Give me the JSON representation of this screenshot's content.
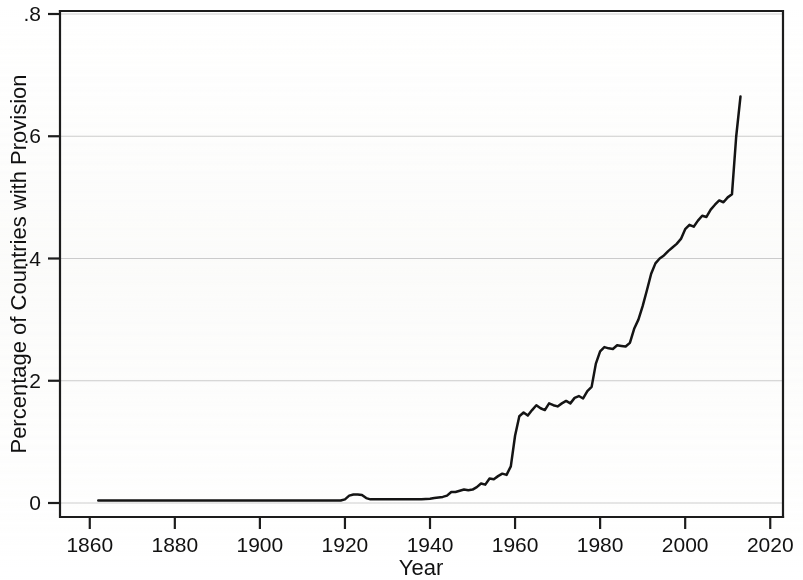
{
  "chart_data": {
    "type": "line",
    "title": "",
    "subtitle": "",
    "xlabel": "Year",
    "ylabel": "Percentage of Countries with Provision",
    "xlim": [
      1853,
      2023
    ],
    "ylim": [
      0,
      0.8
    ],
    "grid": true,
    "grid_axis": "y",
    "legend": false,
    "legend_position": "none",
    "line_color": "#141414",
    "axis_color": "#1c1c1c",
    "grid_color": "#cfcfcf",
    "background_color": "#ffffff",
    "xticks": [
      1860,
      1880,
      1900,
      1920,
      1940,
      1960,
      1980,
      2000,
      2020
    ],
    "xtick_labels": [
      "1860",
      "1880",
      "1900",
      "1920",
      "1940",
      "1960",
      "1980",
      "2000",
      "2020"
    ],
    "yticks": [
      0,
      0.2,
      0.4,
      0.6,
      0.8
    ],
    "ytick_labels": [
      "0",
      ".2",
      ".4",
      ".6",
      ".8"
    ],
    "series": [
      {
        "name": "Percentage of Countries with Provision",
        "x": [
          1862,
          1870,
          1880,
          1890,
          1900,
          1910,
          1915,
          1918,
          1919,
          1920,
          1921,
          1922,
          1923,
          1924,
          1925,
          1926,
          1927,
          1928,
          1930,
          1932,
          1935,
          1938,
          1940,
          1941,
          1942,
          1943,
          1944,
          1945,
          1946,
          1947,
          1948,
          1949,
          1950,
          1951,
          1952,
          1953,
          1954,
          1955,
          1956,
          1957,
          1958,
          1959,
          1960,
          1961,
          1962,
          1963,
          1964,
          1965,
          1966,
          1967,
          1968,
          1969,
          1970,
          1971,
          1972,
          1973,
          1974,
          1975,
          1976,
          1977,
          1978,
          1979,
          1980,
          1981,
          1982,
          1983,
          1984,
          1985,
          1986,
          1987,
          1988,
          1989,
          1990,
          1991,
          1992,
          1993,
          1994,
          1995,
          1996,
          1997,
          1998,
          1999,
          2000,
          2001,
          2002,
          2003,
          2004,
          2005,
          2006,
          2007,
          2008,
          2009,
          2010,
          2011,
          2012,
          2013
        ],
        "y": [
          0.004,
          0.004,
          0.004,
          0.004,
          0.004,
          0.004,
          0.004,
          0.004,
          0.004,
          0.006,
          0.012,
          0.014,
          0.014,
          0.013,
          0.008,
          0.006,
          0.006,
          0.006,
          0.006,
          0.006,
          0.006,
          0.006,
          0.007,
          0.008,
          0.009,
          0.01,
          0.012,
          0.018,
          0.018,
          0.02,
          0.022,
          0.021,
          0.022,
          0.026,
          0.032,
          0.03,
          0.04,
          0.039,
          0.044,
          0.048,
          0.046,
          0.06,
          0.11,
          0.142,
          0.148,
          0.143,
          0.152,
          0.16,
          0.155,
          0.152,
          0.163,
          0.16,
          0.158,
          0.163,
          0.167,
          0.163,
          0.172,
          0.175,
          0.171,
          0.183,
          0.19,
          0.228,
          0.248,
          0.255,
          0.253,
          0.252,
          0.258,
          0.257,
          0.256,
          0.262,
          0.285,
          0.3,
          0.322,
          0.348,
          0.375,
          0.392,
          0.4,
          0.405,
          0.412,
          0.418,
          0.424,
          0.432,
          0.448,
          0.455,
          0.452,
          0.462,
          0.47,
          0.468,
          0.48,
          0.488,
          0.495,
          0.492,
          0.5,
          0.505,
          0.6,
          0.665
        ]
      }
    ]
  }
}
